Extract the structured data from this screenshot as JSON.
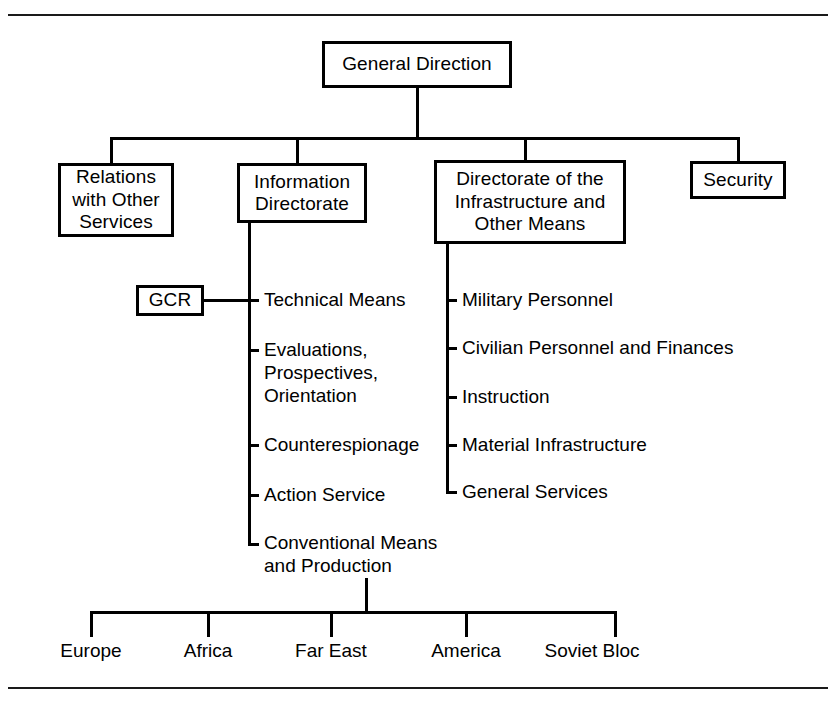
{
  "figure": {
    "type": "organizational-chart",
    "root": {
      "label": "General Direction"
    },
    "level2": [
      {
        "label": "Relations\nwith Other\nServices"
      },
      {
        "label": "Information\nDirectorate"
      },
      {
        "label": "Directorate of the\nInfrastructure and\nOther Means"
      },
      {
        "label": "Security"
      }
    ],
    "information_directorate_units": [
      {
        "label": "Technical Means"
      },
      {
        "label": "Evaluations,\nProspectives,\nOrientation"
      },
      {
        "label": "Counterespionage"
      },
      {
        "label": "Action Service"
      },
      {
        "label": "Conventional Means\nand Production"
      }
    ],
    "attached_unit": {
      "label": "GCR"
    },
    "infrastructure_units": [
      {
        "label": "Military Personnel"
      },
      {
        "label": "Civilian Personnel and Finances"
      },
      {
        "label": "Instruction"
      },
      {
        "label": "Material Infrastructure"
      },
      {
        "label": "General Services"
      }
    ],
    "regions": [
      {
        "label": "Europe"
      },
      {
        "label": "Africa"
      },
      {
        "label": "Far East"
      },
      {
        "label": "America"
      },
      {
        "label": "Soviet Bloc"
      }
    ],
    "colors": {
      "line": "#000000",
      "background": "#ffffff",
      "text": "#000000"
    }
  }
}
